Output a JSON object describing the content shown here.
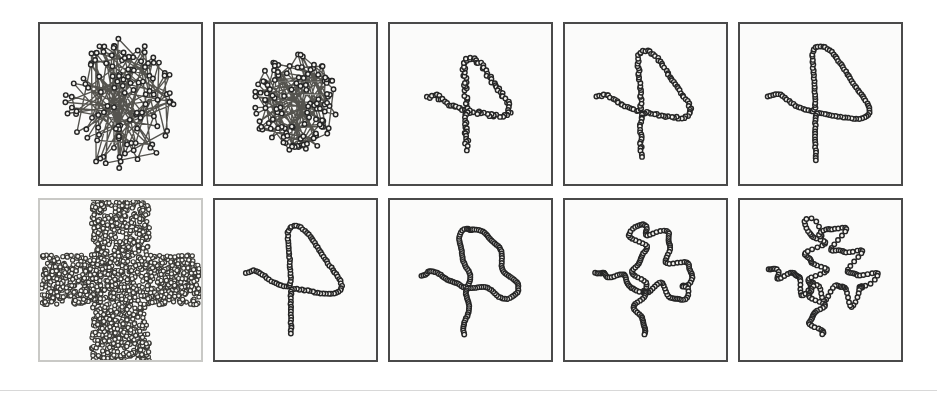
{
  "figure": {
    "background_color": "#ffffff",
    "panel_background_color": "#fbfbfa",
    "panel_border_color": "#4a4a4a",
    "faint_panel_border_color": "#c9c9c6",
    "marker_fill_color": "#f4f3ef",
    "marker_stroke_color": "#262626",
    "line_color": "#3a3a3a",
    "rows": 2,
    "cols": 5,
    "panel_width": 165,
    "panel_height": 164,
    "col_gap": 10,
    "row_gap": 12,
    "grid_left": 38,
    "grid_top": 22,
    "bottom_rule_y": 390,
    "bottom_rule_color": "#d8d8d8"
  },
  "chart_data": {
    "type": "scatter",
    "xlabel": "",
    "ylabel": "",
    "xlim": [
      0,
      1
    ],
    "ylim": [
      0,
      1
    ],
    "grid": false,
    "legend": null,
    "panels": [
      {
        "index": 0,
        "row": 0,
        "col": 0,
        "name": "top-iteration-1",
        "description": "Initial random tangled ring of nodes; heavily self-crossing polyline",
        "series_type": "path",
        "node_count": 118,
        "shape": "random-tangle",
        "seed": 11,
        "spread": 0.4,
        "center": [
          0.5,
          0.5
        ],
        "marker_radius": 2.3
      },
      {
        "index": 1,
        "row": 0,
        "col": 1,
        "name": "top-iteration-2",
        "description": "Partially contracted tangle, nodes pulled toward centre",
        "series_type": "path",
        "node_count": 118,
        "shape": "random-tangle",
        "seed": 29,
        "spread": 0.3,
        "center": [
          0.5,
          0.5
        ],
        "marker_radius": 2.3
      },
      {
        "index": 2,
        "row": 0,
        "col": 2,
        "name": "top-iteration-3",
        "description": "Curve has untangled into a lambda-like loop with a tail",
        "series_type": "path",
        "node_count": 118,
        "shape": "lambda-loop",
        "scale": 0.8,
        "jitter": 0.022,
        "seed": 3,
        "marker_radius": 2.3
      },
      {
        "index": 3,
        "row": 0,
        "col": 3,
        "name": "top-iteration-4",
        "description": "Lambda-like loop, smoother and more expanded",
        "series_type": "path",
        "node_count": 118,
        "shape": "lambda-loop",
        "scale": 0.92,
        "jitter": 0.012,
        "seed": 5,
        "marker_radius": 2.3
      },
      {
        "index": 4,
        "row": 0,
        "col": 4,
        "name": "top-iteration-5",
        "description": "Fully relaxed lambda-like loop spanning the panel",
        "series_type": "path",
        "node_count": 118,
        "shape": "lambda-loop",
        "scale": 1.0,
        "jitter": 0.006,
        "seed": 7,
        "marker_radius": 2.3
      },
      {
        "index": 5,
        "row": 1,
        "col": 0,
        "name": "bottom-target-cloud",
        "description": "Dense cross/plus-shaped cloud of sample points (the target distribution)",
        "series_type": "cloud",
        "point_count": 1500,
        "shape": "cross",
        "cross_arm_half_width": 0.155,
        "cross_arm_extent": 0.48,
        "seed": 91,
        "marker_radius": 2.1,
        "faint_border": true
      },
      {
        "index": 6,
        "row": 1,
        "col": 1,
        "name": "bottom-iteration-1",
        "description": "Coarse lambda-like curve beginning to cover the cross",
        "series_type": "path",
        "node_count": 112,
        "shape": "lambda-loop",
        "scale": 0.94,
        "jitter": 0.006,
        "seed": 13,
        "marker_radius": 2.3
      },
      {
        "index": 7,
        "row": 1,
        "col": 2,
        "name": "bottom-iteration-2",
        "description": "Curve develops wiggles and begins to fill the cross arms",
        "series_type": "path",
        "node_count": 150,
        "shape": "cross-fill",
        "wiggle_amplitude": 0.028,
        "wiggle_frequency": 5,
        "seed": 21,
        "marker_radius": 2.3
      },
      {
        "index": 8,
        "row": 1,
        "col": 3,
        "name": "bottom-iteration-3",
        "description": "Curve with more folds, filling the cross arms further",
        "series_type": "path",
        "node_count": 180,
        "shape": "cross-fill",
        "wiggle_amplitude": 0.05,
        "wiggle_frequency": 8,
        "seed": 33,
        "marker_radius": 2.3
      },
      {
        "index": 9,
        "row": 1,
        "col": 4,
        "name": "bottom-iteration-4",
        "description": "Space-filling curve closely matching the cross distribution",
        "series_type": "path",
        "node_count": 205,
        "shape": "cross-fill",
        "wiggle_amplitude": 0.066,
        "wiggle_frequency": 11,
        "seed": 47,
        "marker_radius": 2.3
      }
    ]
  }
}
